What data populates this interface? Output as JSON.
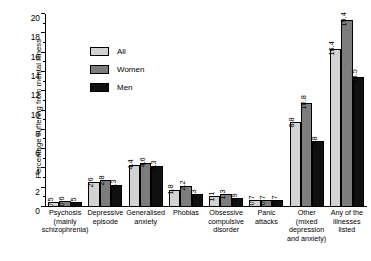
{
  "chart_data": {
    "type": "bar",
    "title": "",
    "xlabel": "",
    "ylabel": "Percentage suffering from mental illness",
    "ylim": [
      0,
      20
    ],
    "ytick_step": 2,
    "yminor_step": 1,
    "grid": false,
    "legend_position": "upper-left-inside",
    "categories": [
      "Psychosis (mainly schizophrenia)",
      "Depressive episode",
      "Generalised anxiety",
      "Phobias",
      "Obsessive compulsive disorder",
      "Panic attacks",
      "Other (mixed depression and anxiety)",
      "Any of the illnesses listed"
    ],
    "category_lines": [
      [
        "Psychosis",
        "(mainly",
        "schizophrenia)"
      ],
      [
        "Depressive",
        "episode"
      ],
      [
        "Generalised",
        "anxiety"
      ],
      [
        "Phobias"
      ],
      [
        "Obsessive",
        "compulsive",
        "disorder"
      ],
      [
        "Panic",
        "attacks"
      ],
      [
        "Other",
        "(mixed",
        "depression",
        "and anxiety)"
      ],
      [
        "Any of the",
        "illnesses",
        "listed"
      ]
    ],
    "yticks": [
      "0",
      "2",
      "4",
      "6",
      "8",
      "10",
      "12",
      "14",
      "16",
      "18",
      "20"
    ],
    "series": [
      {
        "name": "All",
        "color": "#d2d2d2",
        "values": [
          0.5,
          2.6,
          4.4,
          1.8,
          1.1,
          0.7,
          8.8,
          16.4
        ]
      },
      {
        "name": "Women",
        "color": "#7d7d7d",
        "values": [
          0.6,
          2.8,
          4.6,
          2.2,
          1.3,
          0.7,
          10.8,
          19.4
        ]
      },
      {
        "name": "Men",
        "color": "#101010",
        "values": [
          0.5,
          2.3,
          4.3,
          1.3,
          0.9,
          0.7,
          6.8,
          13.5
        ]
      }
    ]
  }
}
